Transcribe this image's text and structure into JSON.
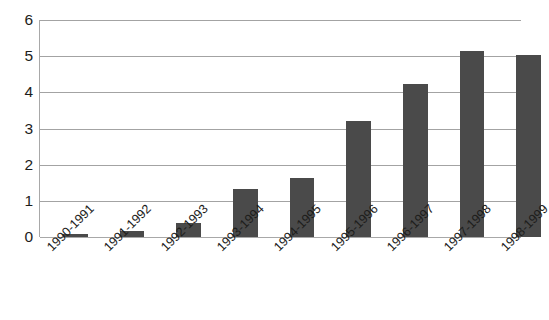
{
  "chart_data": {
    "type": "bar",
    "title": "",
    "subtitle": "",
    "xlabel": "",
    "ylabel": "",
    "categories": [
      "1990-1991",
      "1991-1992",
      "1992-1993",
      "1993-1994",
      "1994-1995",
      "1995-1996",
      "1996-1997",
      "1997-1998",
      "1998-1999"
    ],
    "values": [
      0.08,
      0.18,
      0.4,
      1.33,
      1.63,
      3.22,
      4.23,
      5.13,
      5.03
    ],
    "ylim": [
      0,
      6
    ],
    "ytick_labels": [
      "0",
      "1",
      "2",
      "3",
      "4",
      "5",
      "6"
    ],
    "ytick_values": [
      0,
      1,
      2,
      3,
      4,
      5,
      6
    ],
    "grid": true,
    "legend": false,
    "legend_position": "none",
    "bar_color": "#4a4a4a",
    "gridline_color": "#a3a3a3",
    "axis_color": "#a8a8a8",
    "label_rotation_degrees": -45
  }
}
